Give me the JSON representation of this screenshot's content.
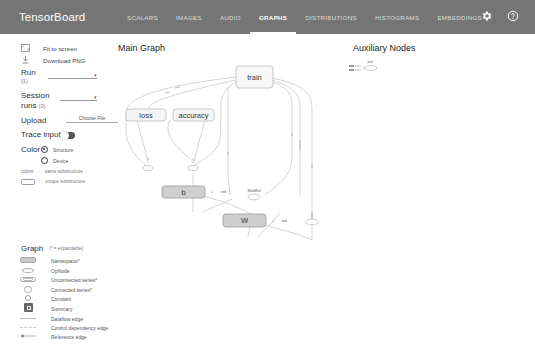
{
  "app": {
    "title": "TensorBoard",
    "tabs": [
      {
        "label": "SCALARS",
        "active": false
      },
      {
        "label": "IMAGES",
        "active": false
      },
      {
        "label": "AUDIO",
        "active": false
      },
      {
        "label": "GRAPHS",
        "active": true
      },
      {
        "label": "DISTRIBUTIONS",
        "active": false
      },
      {
        "label": "HISTOGRAMS",
        "active": false
      },
      {
        "label": "EMBEDDINGS",
        "active": false
      }
    ],
    "icons": [
      "settings-gear-icon",
      "help-icon"
    ]
  },
  "sidebar": {
    "fit_to_screen": "Fit to screen",
    "download_png": "Download PNG",
    "run_label": "Run",
    "run_count": "(1)",
    "session_label": "Session",
    "session_label2": "runs",
    "session_count": "(0)",
    "upload_label": "Upload",
    "choose_file": "Choose File",
    "trace_inputs": "Trace inputs",
    "color_label": "Color",
    "color_options": [
      {
        "label": "Structure",
        "selected": true
      },
      {
        "label": "Device",
        "selected": false
      }
    ],
    "colors_label": "colors",
    "same_substructure": "same substructure",
    "unique_substructure": "unique substructure"
  },
  "legend": {
    "title": "Graph",
    "subtitle": "(* = expandable)",
    "items": [
      {
        "label": "Namespace*",
        "symbol": "namespace"
      },
      {
        "label": "OpNode",
        "symbol": "opnode"
      },
      {
        "label": "Unconnected series*",
        "symbol": "unconnected"
      },
      {
        "label": "Connected series*",
        "symbol": "connected"
      },
      {
        "label": "Constant",
        "symbol": "constant"
      },
      {
        "label": "Summary",
        "symbol": "summary"
      },
      {
        "label": "Dataflow edge",
        "symbol": "dataflow"
      },
      {
        "label": "Control dependency edge",
        "symbol": "control"
      },
      {
        "label": "Reference edge",
        "symbol": "reference"
      }
    ]
  },
  "graph": {
    "main_title": "Main Graph",
    "aux_title": "Auxiliary Nodes",
    "nodes": {
      "train": "train",
      "loss": "loss",
      "accuracy": "accuracy",
      "add": "add",
      "b": "b",
      "matmul": "MatMul",
      "w": "W",
      "init": "init"
    }
  }
}
